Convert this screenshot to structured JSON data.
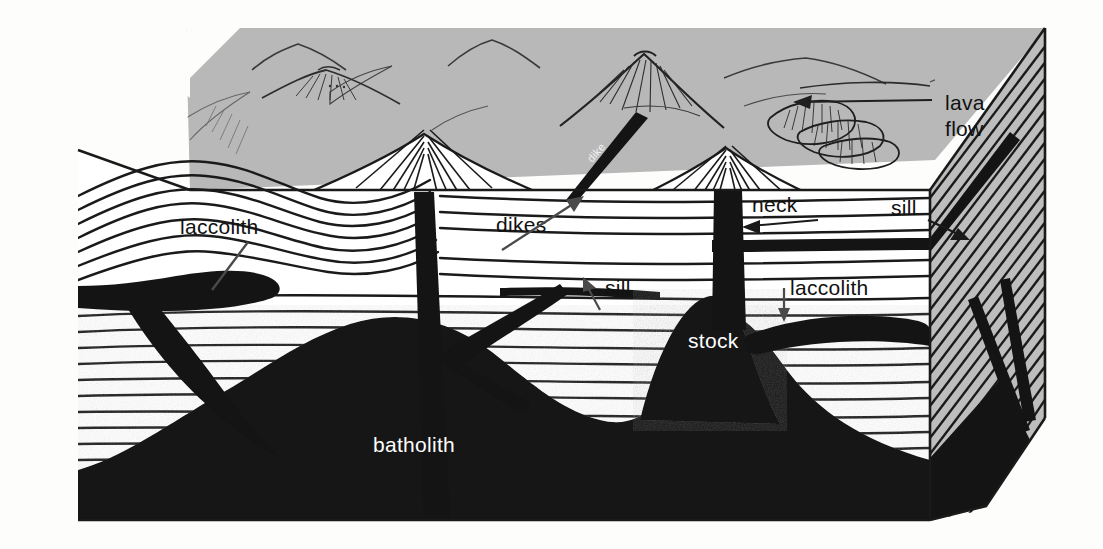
{
  "page": {
    "caption": "different masses formed.",
    "background_color": "#fdfdfb"
  },
  "figure": {
    "colors": {
      "sky": "#b8b8b8",
      "side_face": "#bdbdbd",
      "strata_fill": "#ffffff",
      "igneous_rock": "#141414",
      "line": "#1a1a1a",
      "label_dark": "#111111",
      "label_light": "#ffffff"
    },
    "labels": [
      {
        "id": "lava-flow",
        "text_line1": "lava",
        "text_line2": "flow",
        "x": 945,
        "y": 110,
        "color": "#111111",
        "pointer": "arrow-left"
      },
      {
        "id": "neck",
        "text": "neck",
        "x": 752,
        "y": 212,
        "color": "#111111",
        "pointer": "arrow-left"
      },
      {
        "id": "sill-right",
        "text": "sill",
        "x": 891,
        "y": 215,
        "color": "#111111",
        "pointer": "arrow-down-right"
      },
      {
        "id": "laccolith-left",
        "text": "laccolith",
        "x": 180,
        "y": 234,
        "color": "#111111",
        "pointer": "line-down-left"
      },
      {
        "id": "dikes",
        "text": "dikes",
        "x": 496,
        "y": 232,
        "color": "#111111",
        "pointer": "arrow-up-right"
      },
      {
        "id": "sill-center",
        "text": "sill",
        "x": 605,
        "y": 295,
        "color": "#111111",
        "pointer": "arrow-up-left"
      },
      {
        "id": "laccolith-right",
        "text": "laccolith",
        "x": 790,
        "y": 295,
        "color": "#111111",
        "pointer": "arrow-down"
      },
      {
        "id": "stock",
        "text": "stock",
        "x": 688,
        "y": 348,
        "color": "#ffffff",
        "pointer": "none"
      },
      {
        "id": "batholith",
        "text": "batholith",
        "x": 373,
        "y": 452,
        "color": "#ffffff",
        "pointer": "none"
      },
      {
        "id": "dike-inline",
        "text": "dike",
        "x": 592,
        "y": 160,
        "color": "#f2f2f2",
        "pointer": "none",
        "rotated": true
      }
    ],
    "features": {
      "sky_mountains": 4,
      "volcanoes": 2,
      "lava_flow_lobes": 3,
      "strata_layer_count": 22,
      "side_face_hatch_lines": 26
    }
  }
}
